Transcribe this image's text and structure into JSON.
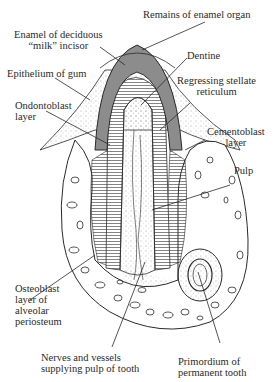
{
  "diagram": {
    "colors": {
      "enamel": "#8c8c8c",
      "line": "#2a2a2a",
      "background": "#ffffff"
    },
    "labels": {
      "remains_enamel_organ": "Remains of enamel organ",
      "enamel_line1": "Enamel of deciduous",
      "enamel_line2": "“milk” incisor",
      "dentine": "Dentine",
      "epithelium": "Epithelium of gum",
      "stellate_line1": "Regressing stellate",
      "stellate_line2": "reticulum",
      "odontoblast_line1": "Ondontoblast",
      "odontoblast_line2": "layer",
      "cementoblast_line1": "Cementoblast",
      "cementoblast_line2": "layer",
      "pulp": "Pulp",
      "osteoblast_line1": "Osteoblast",
      "osteoblast_line2": "layer of",
      "osteoblast_line3": "alveolar",
      "osteoblast_line4": "periosteum",
      "nerves_line1": "Nerves and vessels",
      "nerves_line2": "supplying pulp of tooth",
      "primordium_line1": "Primordium of",
      "primordium_line2": "permanent tooth"
    }
  }
}
